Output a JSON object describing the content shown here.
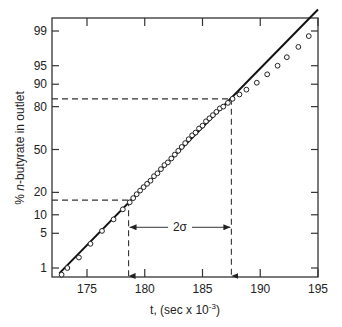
{
  "chart_data": {
    "type": "scatter",
    "title": "",
    "xlabel": "t, (sec x 10",
    "xlabel_exp": "-3",
    "xlabel_close": ")",
    "ylabel": "% n-butyrate in outlet",
    "ylabel_prefix": "% ",
    "ylabel_italic": "n",
    "ylabel_suffix": "-butyrate in outlet",
    "y_scale": "probability",
    "xlim": [
      172.5,
      195
    ],
    "ylim": [
      0.6,
      99.7
    ],
    "x_ticks": [
      175,
      180,
      185,
      190,
      195
    ],
    "x_tick_labels": [
      "175",
      "180",
      "185",
      "190",
      "195"
    ],
    "y_ticks": [
      1,
      5,
      10,
      20,
      50,
      80,
      90,
      95,
      99
    ],
    "y_tick_labels": [
      "1",
      "5",
      "10",
      "20",
      "50",
      "80",
      "90",
      "95",
      "99"
    ],
    "grid": false,
    "legend": null,
    "fit_line": {
      "name": "normal fit",
      "points": [
        [
          172.6,
          0.75
        ],
        [
          195,
          99.7
        ]
      ]
    },
    "series": [
      {
        "name": "data points",
        "marker": "open-circle",
        "x": [
          172.8,
          173.3,
          174.3,
          175.3,
          176.3,
          177.3,
          178.1,
          178.7,
          179.0,
          179.3,
          179.6,
          179.9,
          180.2,
          180.5,
          180.8,
          181.1,
          181.4,
          181.7,
          182.0,
          182.3,
          182.6,
          182.9,
          183.2,
          183.5,
          183.8,
          184.1,
          184.4,
          184.7,
          185.0,
          185.3,
          185.6,
          185.9,
          186.2,
          186.5,
          186.8,
          187.2,
          187.6,
          188.2,
          188.8,
          189.7,
          190.6,
          191.5,
          192.3,
          193.3,
          194.2
        ],
        "y": [
          0.7,
          1.0,
          1.7,
          3.2,
          5.5,
          8.5,
          12,
          15,
          17,
          19,
          21,
          23,
          25,
          27,
          30,
          32,
          35,
          38,
          40,
          43,
          46,
          49,
          52,
          55,
          58,
          61,
          63,
          66,
          68,
          71,
          73,
          75,
          77,
          79,
          80,
          82,
          84,
          86,
          88,
          90.5,
          93,
          95,
          96.5,
          97.8,
          98.7
        ]
      }
    ],
    "annotations": [
      {
        "type": "dashed-h",
        "y": 84,
        "x_to": 187.5
      },
      {
        "type": "dashed-h",
        "y": 16,
        "x_to": 178.6
      },
      {
        "type": "dashed-v-arrow",
        "x": 178.6,
        "from_y": 16
      },
      {
        "type": "dashed-v-arrow",
        "x": 187.5,
        "from_y": 84
      },
      {
        "type": "double-arrow",
        "label": "2σ",
        "x_from": 178.6,
        "x_to": 187.5,
        "y": 5
      }
    ]
  }
}
